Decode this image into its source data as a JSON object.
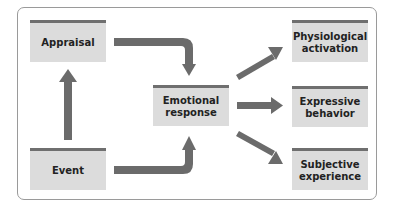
{
  "diagram": {
    "title": "",
    "colors": {
      "box_fill": "#dcdcdc",
      "box_top_bar": "#6f6f6f",
      "arrow": "#6b6b6b",
      "frame_border": "#9a9a9a"
    },
    "nodes": {
      "appraisal": "Appraisal",
      "event": "Event",
      "emotional_response": "Emotional\nresponse",
      "physiological_activation": "Physiological\nactivation",
      "expressive_behavior": "Expressive\nbehavior",
      "subjective_experience": "Subjective\nexperience"
    },
    "edges": [
      {
        "from": "Event",
        "to": "Appraisal"
      },
      {
        "from": "Appraisal",
        "to": "Emotional response"
      },
      {
        "from": "Event",
        "to": "Emotional response"
      },
      {
        "from": "Emotional response",
        "to": "Physiological activation"
      },
      {
        "from": "Emotional response",
        "to": "Expressive behavior"
      },
      {
        "from": "Emotional response",
        "to": "Subjective experience"
      }
    ]
  }
}
